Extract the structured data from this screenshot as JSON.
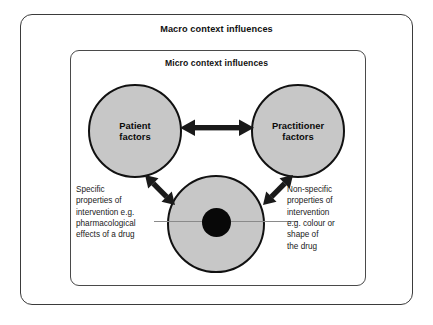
{
  "diagram": {
    "macro_frame": {
      "title": "Macro context influences"
    },
    "micro_frame": {
      "title": "Micro context influences"
    },
    "nodes": [
      {
        "id": "patient",
        "label": "Patient\nfactors"
      },
      {
        "id": "practitioner",
        "label": "Practitioner\nfactors"
      },
      {
        "id": "intervention",
        "label": ""
      }
    ],
    "captions": {
      "left": "Specific\nproperties of\nintervention e.g.\npharmacological\neffects of a drug",
      "right": "Non-specific\nproperties of\nintervention\ne.g. colour or\nshape of\nthe drug"
    },
    "connectors": [
      {
        "id": "patient-practitioner",
        "type": "double-arrow",
        "orientation": "horizontal"
      },
      {
        "id": "patient-intervention",
        "type": "double-arrow",
        "orientation": "diagonal-down-right"
      },
      {
        "id": "practitioner-intervention",
        "type": "double-arrow",
        "orientation": "diagonal-down-left"
      },
      {
        "id": "leader-left",
        "type": "leader-line"
      },
      {
        "id": "leader-right",
        "type": "leader-line"
      }
    ],
    "colors": {
      "circle_fill": "#c7c7c7",
      "circle_stroke": "#111111",
      "inner_dot": "#080808",
      "frame_stroke": "#3b3b3b",
      "arrow": "#1a1a1a",
      "leader_line": "#8a8a8a",
      "text": "#111111",
      "background": "#ffffff"
    }
  }
}
